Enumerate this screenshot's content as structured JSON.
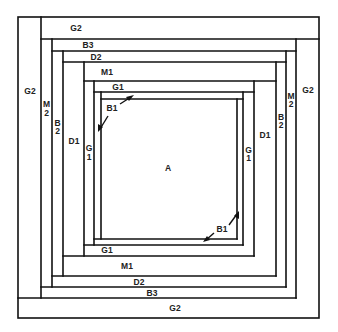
{
  "diagram": {
    "type": "log-cabin-quilt-block",
    "center": {
      "label": "A"
    },
    "labels": {
      "top": [
        "G2",
        "B3",
        "D2",
        "M1",
        "G1"
      ],
      "bottom": [
        "G1",
        "M1",
        "D2",
        "B3",
        "G2"
      ],
      "left_outer": "G2",
      "left": {
        "m2_top": "M",
        "m2_bottom": "2",
        "b2_top": "B",
        "b2_bottom": "2",
        "d1": "D1",
        "g1_top": "G",
        "g1_bottom": "1"
      },
      "right_outer": "G2",
      "right": {
        "m2_top": "M",
        "m2_bottom": "2",
        "b2_top": "B",
        "b2_bottom": "2",
        "d1": "D1",
        "g1_top": "G",
        "g1_bottom": "1"
      },
      "callout_top_left": "B1",
      "callout_bottom_right": "B1"
    },
    "colors": {
      "line": "#111111",
      "text": "#222222",
      "background": "#ffffff"
    }
  }
}
